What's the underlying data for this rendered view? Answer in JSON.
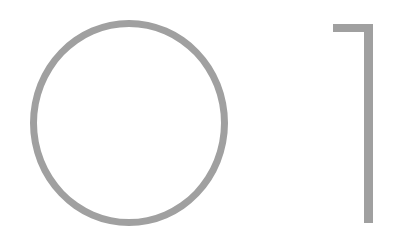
{
  "display": {
    "text": "01",
    "digits": [
      "0",
      "1"
    ],
    "color": "#a0a0a0",
    "background": "#ffffff"
  }
}
